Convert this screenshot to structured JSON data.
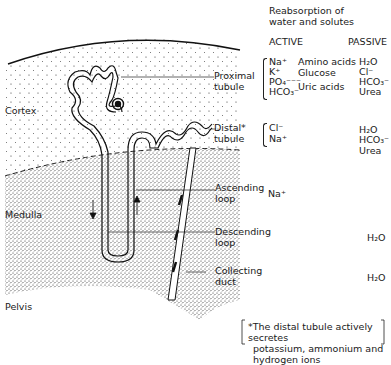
{
  "header": {
    "title_line1": "Reabsorption of",
    "title_line2": "water and solutes",
    "col_active": "ACTIVE",
    "col_passive": "PASSIVE"
  },
  "regions": {
    "cortex": "Cortex",
    "medulla": "Medulla",
    "pelvis": "Pelvis"
  },
  "segments": [
    {
      "name_line1": "Proximal",
      "name_line2": "tubule",
      "active_ions": [
        "Na⁺",
        "K⁺",
        "PO₄⁻⁻⁻",
        "HCO₃⁻"
      ],
      "active_other": [
        "Amino acids",
        "Glucose",
        "Uric acids"
      ],
      "passive": [
        "H₂O",
        "Cl⁻",
        "HCO₃⁻",
        "Urea"
      ]
    },
    {
      "name_line1": "Distal*",
      "name_line2": "tubule",
      "active_ions": [
        "Cl⁻",
        "Na⁺"
      ],
      "active_other": [],
      "passive": [
        "H₂O",
        "HCO₃⁻",
        "Urea"
      ]
    },
    {
      "name_line1": "Ascending",
      "name_line2": "loop",
      "active_ions": [
        "Na⁺"
      ],
      "active_other": [],
      "passive": []
    },
    {
      "name_line1": "Descending",
      "name_line2": "loop",
      "active_ions": [],
      "active_other": [],
      "passive": [
        "H₂O"
      ]
    },
    {
      "name_line1": "Collecting",
      "name_line2": "duct",
      "active_ions": [],
      "active_other": [],
      "passive": [
        "H₂O"
      ]
    }
  ],
  "footnote": {
    "line1": "*The distal tubule actively secretes",
    "line2": "potassium, ammonium and hydrogen ions"
  }
}
